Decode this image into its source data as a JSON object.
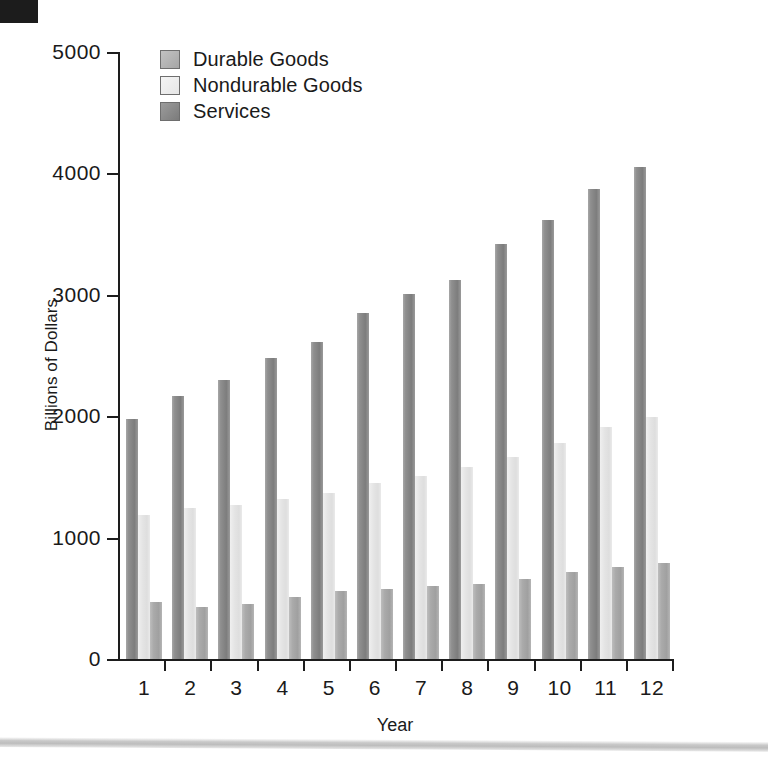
{
  "chart_data": {
    "type": "bar",
    "title": "",
    "xlabel": "Year",
    "ylabel": "Billions of Dollars",
    "categories": [
      "1",
      "2",
      "3",
      "4",
      "5",
      "6",
      "7",
      "8",
      "9",
      "10",
      "11",
      "12"
    ],
    "ylim": [
      0,
      5000
    ],
    "yticks": [
      0,
      1000,
      2000,
      3000,
      4000,
      5000
    ],
    "ytick_labels": [
      "0",
      "1000",
      "2000",
      "3000",
      "4000",
      "5000"
    ],
    "grid": false,
    "legend_position": "top-left",
    "bar_order_in_group": [
      "Services",
      "Nondurable Goods",
      "Durable Goods"
    ],
    "series": [
      {
        "name": "Durable Goods",
        "color": "#aaaaaa",
        "values": [
          470,
          430,
          455,
          510,
          560,
          580,
          605,
          620,
          655,
          715,
          755,
          790
        ]
      },
      {
        "name": "Nondurable Goods",
        "color": "#e4e4e4",
        "values": [
          1185,
          1240,
          1270,
          1320,
          1370,
          1450,
          1510,
          1585,
          1660,
          1780,
          1915,
          1995
        ]
      },
      {
        "name": "Services",
        "color": "#8f8f8f",
        "values": [
          1975,
          2170,
          2300,
          2480,
          2615,
          2850,
          3010,
          3120,
          3415,
          3620,
          3870,
          4050
        ]
      }
    ]
  },
  "legend": {
    "items": [
      {
        "label": "Durable Goods",
        "swatch": "durable"
      },
      {
        "label": "Nondurable Goods",
        "swatch": "nondurable"
      },
      {
        "label": "Services",
        "swatch": "services"
      }
    ]
  },
  "colors": {
    "axis": "#1d1d1d",
    "background": "#ffffff",
    "durable": "#aaaaaa",
    "nondurable": "#e4e4e4",
    "services": "#8f8f8f"
  }
}
